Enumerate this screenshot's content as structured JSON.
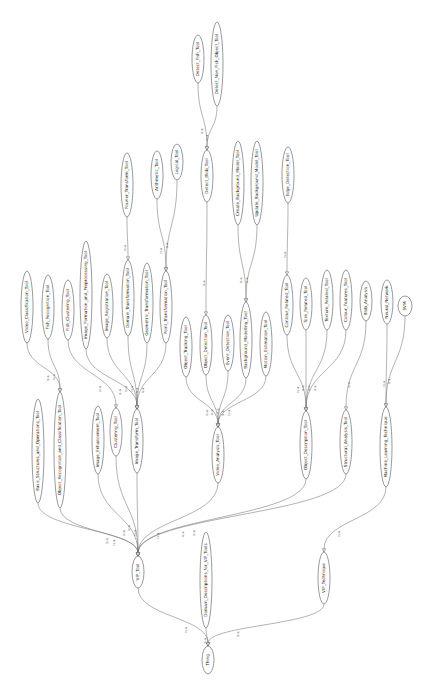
{
  "diagram": {
    "type": "ontology-graph",
    "orientation": "rotated-90-ccw",
    "edge_label": "is-a",
    "colors": {
      "stroke": "#555555",
      "fill": "#ffffff",
      "text": "#222222"
    },
    "nodes": [
      {
        "id": "Thing",
        "label": "Thing",
        "x": 208,
        "y": 660,
        "rx": 6,
        "ry": 14
      },
      {
        "id": "VIP_Tool",
        "label": "VIP_Tool",
        "x": 138,
        "y": 572,
        "rx": 6,
        "ry": 16
      },
      {
        "id": "Domain_Descriptions_for_VIP_Tools",
        "label": "Domain_Descriptions_for_VIP_Tools",
        "x": 206,
        "y": 580,
        "rx": 6,
        "ry": 48
      },
      {
        "id": "VIP_Technique",
        "label": "VIP_Technique",
        "x": 324,
        "y": 578,
        "rx": 6,
        "ry": 26
      },
      {
        "id": "Image_Transform_Tool",
        "label": "Image_Transform_Tool",
        "x": 137,
        "y": 441,
        "rx": 6,
        "ry": 32
      },
      {
        "id": "Video_Analysis_Tool",
        "label": "Video_Analysis_Tool",
        "x": 218,
        "y": 455,
        "rx": 6,
        "ry": 28
      },
      {
        "id": "Object_Description_Tool",
        "label": "Object_Description_Tool",
        "x": 306,
        "y": 445,
        "rx": 6,
        "ry": 34
      },
      {
        "id": "Structural_Analysis_Tool",
        "label": "Structural_Analysis_Tool",
        "x": 346,
        "y": 442,
        "rx": 6,
        "ry": 32
      },
      {
        "id": "Machine_Learning_Technique",
        "label": "Machine_Learning_Technique",
        "x": 386,
        "y": 447,
        "rx": 6,
        "ry": 40
      },
      {
        "id": "Basic_Structures_and_Operations_Tool",
        "label": "Basic_Structures_and_Operations_Tool",
        "x": 38,
        "y": 451,
        "rx": 6,
        "ry": 52
      },
      {
        "id": "Object_Recognition_and_Classification_Tool",
        "label": "Object_Recognition_and_Classification_Tool",
        "x": 60,
        "y": 450,
        "rx": 6,
        "ry": 58
      },
      {
        "id": "Image_Enhancement_Tool",
        "label": "Image_Enhancement_Tool",
        "x": 98,
        "y": 440,
        "rx": 6,
        "ry": 34
      },
      {
        "id": "Clustering_Tool",
        "label": "Clustering_Tool",
        "x": 116,
        "y": 432,
        "rx": 6,
        "ry": 24
      },
      {
        "id": "Video_Classification_Tool",
        "label": "Video_Classification_Tool",
        "x": 27,
        "y": 307,
        "rx": 6,
        "ry": 36
      },
      {
        "id": "Fish_Recognition_Tool",
        "label": "Fish_Recognition_Tool",
        "x": 48,
        "y": 307,
        "rx": 6,
        "ry": 32
      },
      {
        "id": "Fish_Clustering_Tool",
        "label": "Fish_Clustering_Tool",
        "x": 68,
        "y": 310,
        "rx": 6,
        "ry": 30
      },
      {
        "id": "Image_Formation_and_Preprocessing_Tool",
        "label": "Image_Formation_and_Preprocessing_Tool",
        "x": 86,
        "y": 295,
        "rx": 6,
        "ry": 54
      },
      {
        "id": "Image_Registration_Tool",
        "label": "Image_Registration_Tool",
        "x": 107,
        "y": 306,
        "rx": 6,
        "ry": 32
      },
      {
        "id": "Domain_Transformation_Tool",
        "label": "Domain_Transformation_Tool",
        "x": 128,
        "y": 298,
        "rx": 6,
        "ry": 38
      },
      {
        "id": "Geometric_Transformation_Tool",
        "label": "Geometric_Transformation_Tool",
        "x": 147,
        "y": 303,
        "rx": 6,
        "ry": 40
      },
      {
        "id": "Point_Transformation_Tool",
        "label": "Point_Transformation_Tool",
        "x": 166,
        "y": 307,
        "rx": 6,
        "ry": 36
      },
      {
        "id": "Fourier_Transform_Tool",
        "label": "Fourier_Transform_Tool",
        "x": 127,
        "y": 185,
        "rx": 6,
        "ry": 32
      },
      {
        "id": "Arithmetic_Tool",
        "label": "Arithmetic_Tool",
        "x": 157,
        "y": 175,
        "rx": 6,
        "ry": 24
      },
      {
        "id": "Logical_Tool",
        "label": "Logical_Tool",
        "x": 177,
        "y": 162,
        "rx": 6,
        "ry": 18
      },
      {
        "id": "Object_Tracking_Tool",
        "label": "Object_Tracking_Tool",
        "x": 186,
        "y": 347,
        "rx": 6,
        "ry": 30
      },
      {
        "id": "Object_Detection_Tool",
        "label": "Object_Detection_Tool",
        "x": 206,
        "y": 345,
        "rx": 6,
        "ry": 30
      },
      {
        "id": "Event_Detection_Tool",
        "label": "Event_Detection_Tool",
        "x": 228,
        "y": 343,
        "rx": 6,
        "ry": 28
      },
      {
        "id": "Background_Modelling_Tool",
        "label": "Background_Modelling_Tool",
        "x": 246,
        "y": 340,
        "rx": 6,
        "ry": 38
      },
      {
        "id": "Motion_Estimation_Tool",
        "label": "Motion_Estimation_Tool",
        "x": 266,
        "y": 344,
        "rx": 6,
        "ry": 32
      },
      {
        "id": "Detect_Blob_Tool",
        "label": "Detect_Blob_Tool",
        "x": 207,
        "y": 176,
        "rx": 6,
        "ry": 26
      },
      {
        "id": "Detect_Fish_Tool",
        "label": "Detect_Fish_Tool",
        "x": 198,
        "y": 59,
        "rx": 6,
        "ry": 24
      },
      {
        "id": "Detect_Non_Fish_Object_Tool",
        "label": "Detect_Non_Fish_Object_Tool",
        "x": 217,
        "y": 64,
        "rx": 6,
        "ry": 42
      },
      {
        "id": "Create_Background_Model_Tool",
        "label": "Create_Background_Model_Tool",
        "x": 238,
        "y": 183,
        "rx": 6,
        "ry": 42
      },
      {
        "id": "Update_Background_Model_Tool",
        "label": "Update_Background_Model_Tool",
        "x": 257,
        "y": 183,
        "rx": 6,
        "ry": 42
      },
      {
        "id": "Edge_Detection_Tool",
        "label": "Edge_Detection_Tool",
        "x": 288,
        "y": 175,
        "rx": 6,
        "ry": 28
      },
      {
        "id": "Contour_Related_Tool",
        "label": "Contour_Related_Tool",
        "x": 287,
        "y": 305,
        "rx": 6,
        "ry": 30
      },
      {
        "id": "Size_Related_Tool",
        "label": "Size_Related_Tool",
        "x": 306,
        "y": 304,
        "rx": 6,
        "ry": 26
      },
      {
        "id": "Texture_Related_Tool",
        "label": "Texture_Related_Tool",
        "x": 327,
        "y": 300,
        "rx": 6,
        "ry": 30
      },
      {
        "id": "Colour_Features_Tool",
        "label": "Colour_Features_Tool",
        "x": 346,
        "y": 300,
        "rx": 6,
        "ry": 30
      },
      {
        "id": "Blob_Analysis",
        "label": "Blob_Analysis",
        "x": 366,
        "y": 301,
        "rx": 6,
        "ry": 20
      },
      {
        "id": "Neural_Network",
        "label": "Neural_Network",
        "x": 387,
        "y": 302,
        "rx": 6,
        "ry": 22
      },
      {
        "id": "SVM",
        "label": "SVM",
        "x": 405,
        "y": 306,
        "rx": 7,
        "ry": 10
      }
    ],
    "edges": [
      {
        "from": "VIP_Tool",
        "to": "Thing",
        "label": "is-a"
      },
      {
        "from": "Domain_Descriptions_for_VIP_Tools",
        "to": "Thing",
        "label": "is-a"
      },
      {
        "from": "VIP_Technique",
        "to": "Thing",
        "label": "is-a"
      },
      {
        "from": "Basic_Structures_and_Operations_Tool",
        "to": "VIP_Tool",
        "label": "is-a"
      },
      {
        "from": "Object_Recognition_and_Classification_Tool",
        "to": "VIP_Tool",
        "label": "is-a"
      },
      {
        "from": "Image_Enhancement_Tool",
        "to": "VIP_Tool",
        "label": "is-a"
      },
      {
        "from": "Clustering_Tool",
        "to": "VIP_Tool",
        "label": "is-a"
      },
      {
        "from": "Image_Transform_Tool",
        "to": "VIP_Tool",
        "label": "is-a"
      },
      {
        "from": "Video_Analysis_Tool",
        "to": "VIP_Tool",
        "label": "is-a"
      },
      {
        "from": "Object_Description_Tool",
        "to": "VIP_Tool",
        "label": "is-a"
      },
      {
        "from": "Structural_Analysis_Tool",
        "to": "VIP_Tool",
        "label": "is-a"
      },
      {
        "from": "Machine_Learning_Technique",
        "to": "VIP_Technique",
        "label": "is-a"
      },
      {
        "from": "Video_Classification_Tool",
        "to": "Object_Recognition_and_Classification_Tool",
        "label": "is-a"
      },
      {
        "from": "Fish_Recognition_Tool",
        "to": "Object_Recognition_and_Classification_Tool",
        "label": "is-a"
      },
      {
        "from": "Fish_Clustering_Tool",
        "to": "Clustering_Tool",
        "label": "is-a"
      },
      {
        "from": "Image_Formation_and_Preprocessing_Tool",
        "to": "Image_Transform_Tool",
        "label": "is-a"
      },
      {
        "from": "Image_Registration_Tool",
        "to": "Image_Transform_Tool",
        "label": "is-a"
      },
      {
        "from": "Domain_Transformation_Tool",
        "to": "Image_Transform_Tool",
        "label": "is-a"
      },
      {
        "from": "Geometric_Transformation_Tool",
        "to": "Image_Transform_Tool",
        "label": "is-a"
      },
      {
        "from": "Point_Transformation_Tool",
        "to": "Image_Transform_Tool",
        "label": "is-a"
      },
      {
        "from": "Fourier_Transform_Tool",
        "to": "Domain_Transformation_Tool",
        "label": "is-a"
      },
      {
        "from": "Arithmetic_Tool",
        "to": "Point_Transformation_Tool",
        "label": "is-a"
      },
      {
        "from": "Logical_Tool",
        "to": "Point_Transformation_Tool",
        "label": "is-a"
      },
      {
        "from": "Object_Tracking_Tool",
        "to": "Video_Analysis_Tool",
        "label": "is-a"
      },
      {
        "from": "Object_Detection_Tool",
        "to": "Video_Analysis_Tool",
        "label": "is-a"
      },
      {
        "from": "Event_Detection_Tool",
        "to": "Video_Analysis_Tool",
        "label": "is-a"
      },
      {
        "from": "Background_Modelling_Tool",
        "to": "Video_Analysis_Tool",
        "label": "is-a"
      },
      {
        "from": "Motion_Estimation_Tool",
        "to": "Video_Analysis_Tool",
        "label": "is-a"
      },
      {
        "from": "Detect_Blob_Tool",
        "to": "Object_Detection_Tool",
        "label": "is-a"
      },
      {
        "from": "Detect_Fish_Tool",
        "to": "Detect_Blob_Tool",
        "label": "is-a"
      },
      {
        "from": "Detect_Non_Fish_Object_Tool",
        "to": "Detect_Blob_Tool",
        "label": "is-a"
      },
      {
        "from": "Create_Background_Model_Tool",
        "to": "Background_Modelling_Tool",
        "label": "is-a"
      },
      {
        "from": "Update_Background_Model_Tool",
        "to": "Background_Modelling_Tool",
        "label": "is-a"
      },
      {
        "from": "Edge_Detection_Tool",
        "to": "Contour_Related_Tool",
        "label": "is-a"
      },
      {
        "from": "Contour_Related_Tool",
        "to": "Object_Description_Tool",
        "label": "is-a"
      },
      {
        "from": "Size_Related_Tool",
        "to": "Object_Description_Tool",
        "label": "is-a"
      },
      {
        "from": "Texture_Related_Tool",
        "to": "Object_Description_Tool",
        "label": "is-a"
      },
      {
        "from": "Colour_Features_Tool",
        "to": "Object_Description_Tool",
        "label": "is-a"
      },
      {
        "from": "Blob_Analysis",
        "to": "Structural_Analysis_Tool",
        "label": "is-a"
      },
      {
        "from": "Neural_Network",
        "to": "Machine_Learning_Technique",
        "label": "is-a"
      },
      {
        "from": "SVM",
        "to": "Machine_Learning_Technique",
        "label": "is-a"
      }
    ]
  }
}
